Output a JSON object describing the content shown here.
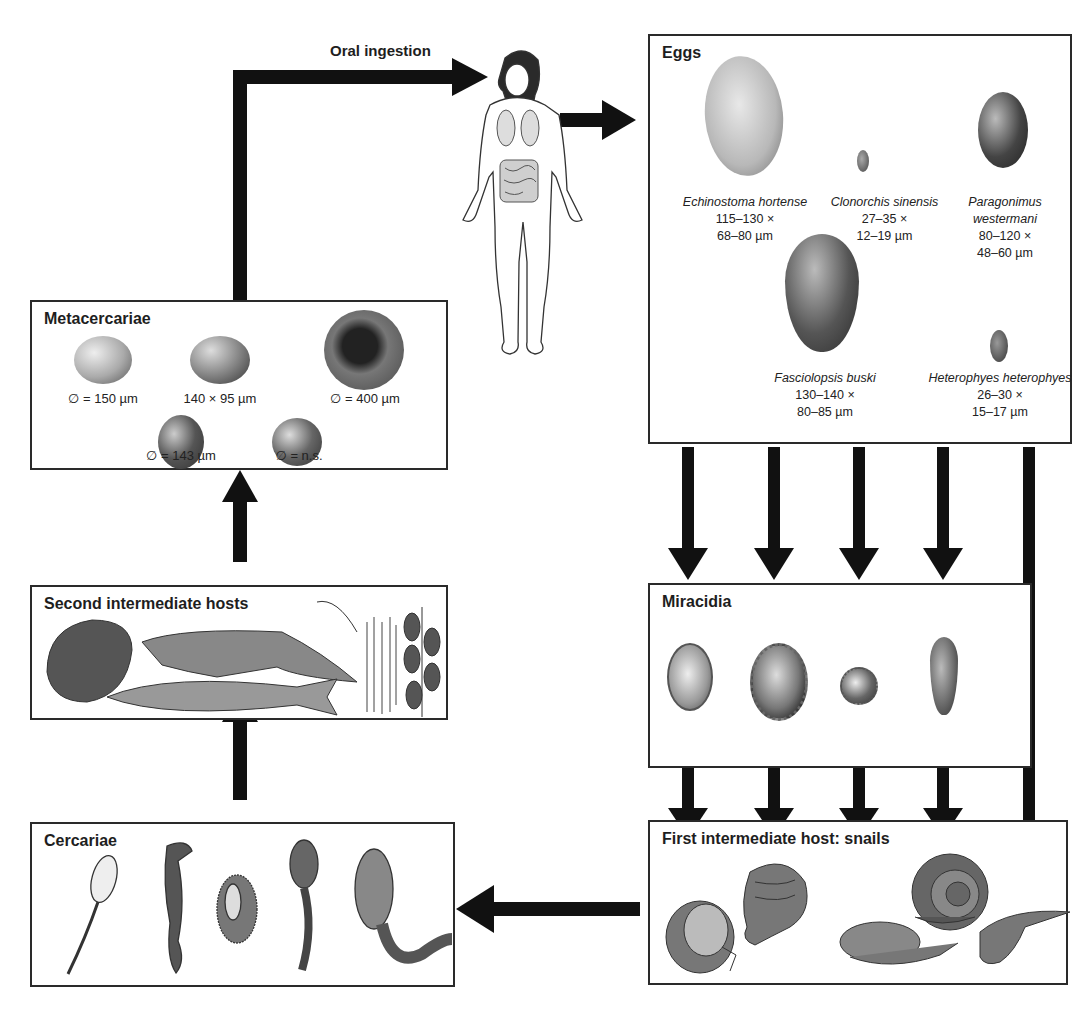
{
  "diagram": {
    "type": "life-cycle",
    "colors": {
      "arrow": "#111111",
      "border": "#2a2a2a",
      "background": "#ffffff",
      "text": "#1e1e1e"
    },
    "human_host": {
      "label": "Oral ingestion",
      "icon": "human-body-icon"
    },
    "eggs": {
      "title": "Eggs",
      "items": [
        {
          "species": "Echinostoma hortense",
          "size_line1": "115–130 ×",
          "size_line2": "68–80 µm"
        },
        {
          "species": "Clonorchis sinensis",
          "size_line1": "27–35 ×",
          "size_line2": "12–19 µm"
        },
        {
          "species_line1": "Paragonimus",
          "species_line2": "westermani",
          "size_line1": "80–120 ×",
          "size_line2": "48–60 µm"
        },
        {
          "species": "Fasciolopsis buski",
          "size_line1": "130–140 ×",
          "size_line2": "80–85 µm"
        },
        {
          "species": "Heterophyes heterophyes",
          "size_line1": "26–30 ×",
          "size_line2": "15–17 µm"
        }
      ]
    },
    "miracidia": {
      "title": "Miracidia",
      "count": 4
    },
    "snails": {
      "title": "First intermediate host: snails",
      "count": 5
    },
    "cercariae": {
      "title": "Cercariae",
      "count": 5
    },
    "second_hosts": {
      "title": "Second intermediate hosts",
      "items": [
        "clam",
        "crayfish",
        "fish",
        "water grass",
        "water plant"
      ]
    },
    "metacercariae": {
      "title": "Metacercariae",
      "items": [
        {
          "size": "∅ = 150 µm"
        },
        {
          "size": "140 × 95 µm"
        },
        {
          "size": "∅ = 400 µm"
        },
        {
          "size": "∅ = 143 µm"
        },
        {
          "size": "∅ = n.s."
        }
      ]
    }
  }
}
